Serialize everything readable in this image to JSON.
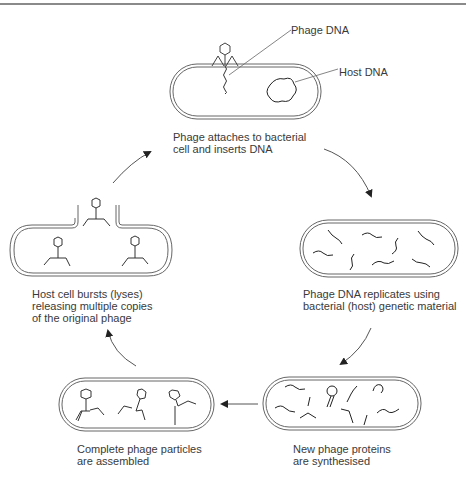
{
  "diagram": {
    "stages": [
      {
        "id": "attach",
        "caption_line1": "Phage attaches to bacterial",
        "caption_line2": "cell and inserts DNA"
      },
      {
        "id": "replicate",
        "caption_line1": "Phage DNA replicates using",
        "caption_line2": "bacterial (host) genetic material"
      },
      {
        "id": "synthesis",
        "caption_line1": "New phage proteins",
        "caption_line2": "are synthesised"
      },
      {
        "id": "assembly",
        "caption_line1": "Complete phage particles",
        "caption_line2": "are assembled"
      },
      {
        "id": "lysis",
        "caption_line1": "Host cell bursts (lyses)",
        "caption_line2": "releasing multiple copies",
        "caption_line3": "of the original phage"
      }
    ],
    "callouts": {
      "phage_dna": "Phage DNA",
      "host_dna": "Host DNA"
    },
    "colors": {
      "line": "#555555",
      "arrow": "#333333",
      "text": "#3a3a3a"
    }
  }
}
